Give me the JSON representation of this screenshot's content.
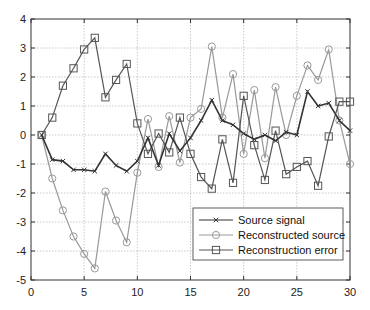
{
  "chart_data": {
    "type": "line",
    "title": "",
    "xlabel": "",
    "ylabel": "",
    "xlim": [
      0,
      30
    ],
    "ylim": [
      -5,
      4
    ],
    "xticks": [
      0,
      5,
      10,
      15,
      20,
      25,
      30
    ],
    "yticks": [
      -5,
      -4,
      -3,
      -2,
      -1,
      0,
      1,
      2,
      3,
      4
    ],
    "grid": true,
    "legend_position": "lower right",
    "x": [
      1,
      2,
      3,
      4,
      5,
      6,
      7,
      8,
      9,
      10,
      11,
      12,
      13,
      14,
      15,
      16,
      17,
      18,
      19,
      20,
      21,
      22,
      23,
      24,
      25,
      26,
      27,
      28,
      29,
      30
    ],
    "series": [
      {
        "name": "Source signal",
        "marker": "x",
        "color": "#333333",
        "values": [
          0,
          -0.85,
          -0.9,
          -1.2,
          -1.2,
          -1.25,
          -0.65,
          -1.05,
          -1.25,
          -0.9,
          -0.1,
          -1.05,
          0.05,
          -0.55,
          -0.1,
          0.5,
          1.2,
          0.5,
          0.35,
          0.05,
          -0.15,
          0.0,
          -0.2,
          0.1,
          0.0,
          1.5,
          1.0,
          1.1,
          0.5,
          0.15
        ]
      },
      {
        "name": "Reconstructed source",
        "marker": "o",
        "color": "#999999",
        "values": [
          0,
          -1.5,
          -2.6,
          -3.5,
          -4.1,
          -4.6,
          -1.95,
          -2.95,
          -3.7,
          -1.3,
          0.55,
          -1.1,
          0.65,
          -0.95,
          0.6,
          0.9,
          3.05,
          0.6,
          2.1,
          -0.65,
          1.55,
          -0.8,
          1.65,
          0.0,
          1.35,
          2.4,
          1.9,
          2.95,
          0.5,
          -1.0
        ]
      },
      {
        "name": "Reconstruction error",
        "marker": "s",
        "color": "#555555",
        "values": [
          0,
          0.6,
          1.7,
          2.3,
          2.95,
          3.35,
          1.3,
          1.9,
          2.45,
          0.4,
          -0.65,
          0.05,
          -0.6,
          0.6,
          -0.65,
          -1.45,
          -1.85,
          -0.15,
          -1.65,
          1.35,
          -0.35,
          -1.55,
          0.15,
          -1.35,
          -1.1,
          -0.9,
          -1.75,
          -0.05,
          1.15,
          1.15
        ]
      }
    ]
  },
  "legend": {
    "items": [
      "Source signal",
      "Reconstructed source",
      "Reconstruction error"
    ]
  }
}
